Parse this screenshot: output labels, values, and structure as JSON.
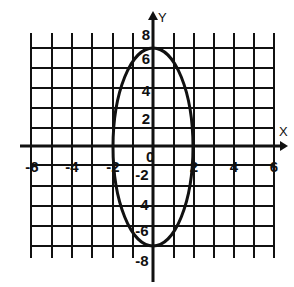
{
  "chart_data": {
    "type": "line",
    "title": "",
    "xlabel": "X",
    "ylabel": "Y",
    "xlim": [
      -6,
      6
    ],
    "ylim": [
      -8,
      8
    ],
    "grid": true,
    "x_ticks": [
      "-6",
      "-4",
      "-2",
      "0",
      "2",
      "4",
      "6"
    ],
    "y_ticks": [
      "8",
      "6",
      "4",
      "2",
      "-2",
      "-4",
      "-6",
      "-8"
    ],
    "series": [
      {
        "name": "ellipse",
        "shape": "ellipse",
        "center": [
          0,
          0
        ],
        "semi_axis_x": 2,
        "semi_axis_y": 7,
        "equation": "x^2/4 + y^2/49 = 1",
        "key_points": [
          [
            2,
            0
          ],
          [
            -2,
            0
          ],
          [
            0,
            7
          ],
          [
            0,
            -7
          ]
        ]
      }
    ]
  },
  "labels": {
    "x_axis": "X",
    "y_axis": "Y",
    "origin": "0",
    "x_ticks": [
      {
        "text": "-6",
        "x": 32,
        "y": 172
      },
      {
        "text": "-4",
        "x": 72,
        "y": 172
      },
      {
        "text": "-2",
        "x": 113,
        "y": 172
      },
      {
        "text": "2",
        "x": 194,
        "y": 172
      },
      {
        "text": "4",
        "x": 234,
        "y": 172
      },
      {
        "text": "6",
        "x": 274,
        "y": 172
      }
    ],
    "y_ticks": [
      {
        "text": "8",
        "x": 146,
        "y": 40
      },
      {
        "text": "6",
        "x": 146,
        "y": 64
      },
      {
        "text": "4",
        "x": 146,
        "y": 96
      },
      {
        "text": "2",
        "x": 146,
        "y": 124
      },
      {
        "text": "-2",
        "x": 142,
        "y": 180
      },
      {
        "text": "-4",
        "x": 142,
        "y": 210
      },
      {
        "text": "-6",
        "x": 142,
        "y": 236
      },
      {
        "text": "-8",
        "x": 142,
        "y": 266
      }
    ]
  }
}
